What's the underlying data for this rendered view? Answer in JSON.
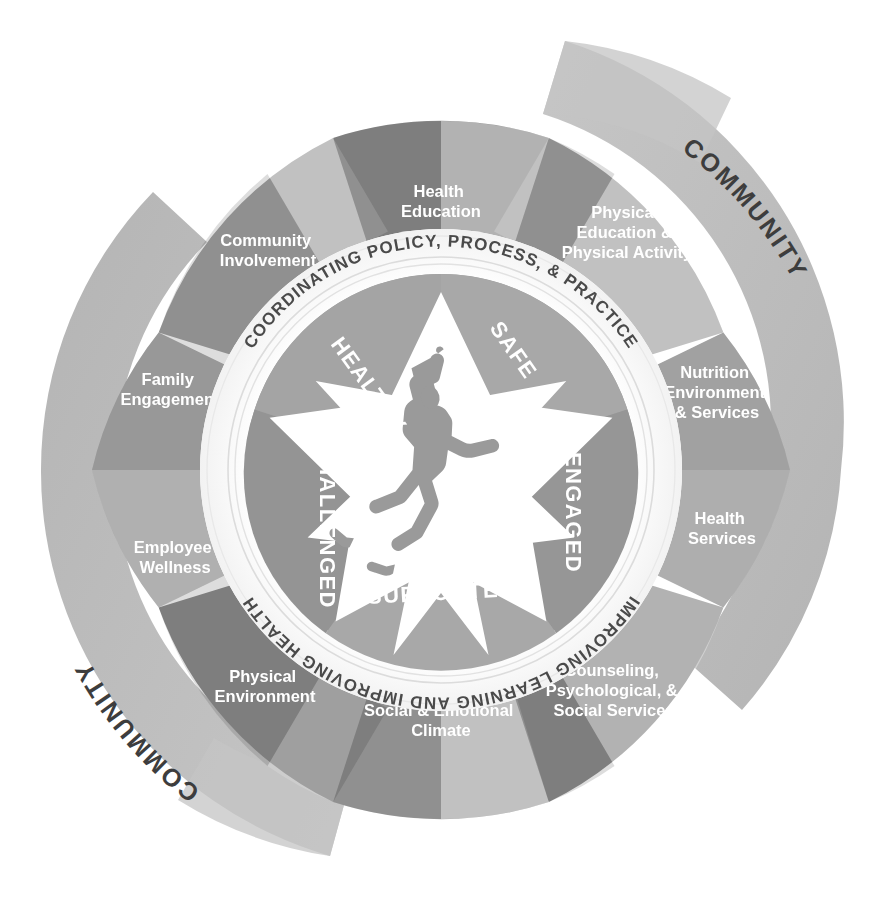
{
  "diagram": {
    "colors": {
      "wedge_dark": "#8f8f8f",
      "wedge_mid": "#a2a2a2",
      "wedge_light": "#b5b5b5",
      "wedge_lighter": "#c2c2c2",
      "outer_arc": "#bdbdbd",
      "outer_arc_shade": "#b0b0b0",
      "inner_hub": "#9a9a9a",
      "star_fill": "#ffffff",
      "figure": "#9a9a9a",
      "ring_band": "#ffffff",
      "ring_text": "#4a4a4a",
      "label_text": "#ffffff",
      "background": "#ffffff"
    },
    "outer_arcs": [
      {
        "label": "COMMUNITY",
        "position": "top-right"
      },
      {
        "label": "COMMUNITY",
        "position": "bottom-left"
      }
    ],
    "ring_texts": {
      "top": "COORDINATING POLICY, PROCESS, & PRACTICE",
      "bottom": "IMPROVING LEARNING AND IMPROVING HEALTH"
    },
    "components": [
      {
        "index": 0,
        "label": "Health Education",
        "lines": [
          "Health",
          "Education"
        ]
      },
      {
        "index": 1,
        "label": "Physical Education & Physical Activity",
        "lines": [
          "Physical",
          "Education &",
          "Physical Activity"
        ]
      },
      {
        "index": 2,
        "label": "Nutrition Environment & Services",
        "lines": [
          "Nutrition",
          "Environment",
          "& Services"
        ]
      },
      {
        "index": 3,
        "label": "Health Services",
        "lines": [
          "Health",
          "Services"
        ]
      },
      {
        "index": 4,
        "label": "Counseling, Psychological, & Social Services",
        "lines": [
          "Counseling,",
          "Psychological, &",
          "Social Services"
        ]
      },
      {
        "index": 5,
        "label": "Social & Emotional Climate",
        "lines": [
          "Social & Emotional",
          "Climate"
        ]
      },
      {
        "index": 6,
        "label": "Physical Environment",
        "lines": [
          "Physical",
          "Environment"
        ]
      },
      {
        "index": 7,
        "label": "Employee Wellness",
        "lines": [
          "Employee",
          "Wellness"
        ]
      },
      {
        "index": 8,
        "label": "Family Engagement",
        "lines": [
          "Family",
          "Engagement"
        ]
      },
      {
        "index": 9,
        "label": "Community Involvement",
        "lines": [
          "Community",
          "Involvement"
        ]
      }
    ],
    "star_segments": [
      {
        "index": 0,
        "label": "HEALTHY"
      },
      {
        "index": 1,
        "label": "SAFE"
      },
      {
        "index": 2,
        "label": "ENGAGED"
      },
      {
        "index": 3,
        "label": "SUPPORTED"
      },
      {
        "index": 4,
        "label": "CHALLENGED"
      }
    ],
    "center_figure": "jumping-child-silhouette"
  }
}
